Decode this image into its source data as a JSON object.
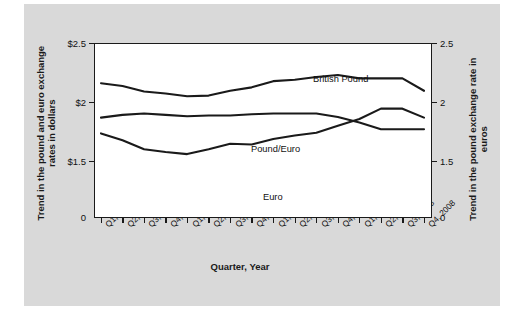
{
  "figure": {
    "background_color": "#d9d9d9",
    "plot_background_color": "#ffffff",
    "line_color": "#1a1a1a"
  },
  "axes": {
    "y_left_title": "Trend in the pound and euro exchange rates in dollars",
    "y_right_title": "Trend in the pound exchange rate in euros",
    "x_title": "Quarter, Year",
    "y_left_ticks": [
      "$2.5",
      "$2",
      "$1.5",
      "0"
    ],
    "y_right_ticks": [
      "2.5",
      "2",
      "1.5",
      "0"
    ]
  },
  "series_labels": {
    "british_pound": "British Pound",
    "pound_euro": "Pound/Euro",
    "euro": "Euro"
  },
  "chart_data": {
    "type": "line",
    "title": "",
    "xlabel": "Quarter, Year",
    "ylabel": "Trend in the pound and euro exchange rates in dollars",
    "ylabel_right": "Trend in the pound exchange rate in euros",
    "ylim": [
      0,
      2.5
    ],
    "ylim_right": [
      0,
      2.5
    ],
    "ytick_values": [
      2.5,
      2.0,
      1.5,
      0
    ],
    "ytick_labels": [
      "$2.5",
      "$2",
      "$1.5",
      "0"
    ],
    "ytick_labels_right": [
      "2.5",
      "2",
      "1.5",
      "0"
    ],
    "grid": false,
    "legend_position": "inline-annotations",
    "categories": [
      "Q1, 2005",
      "Q2, 2005",
      "Q3, 2005",
      "Q4, 2005",
      "Q1, 2006",
      "Q2, 2006",
      "Q3, 2006",
      "Q4, 2006",
      "Q1, 2007",
      "Q2, 2007",
      "Q3, 2007",
      "Q4, 2007",
      "Q1, 2008",
      "Q2, 2008",
      "Q3, 2008",
      "Q4, 2008"
    ],
    "series": [
      {
        "name": "British Pound",
        "values": [
          1.93,
          1.89,
          1.81,
          1.78,
          1.74,
          1.75,
          1.82,
          1.87,
          1.96,
          1.98,
          2.02,
          2.05,
          2.0,
          2.0,
          2.0,
          1.82
        ]
      },
      {
        "name": "Pound/Euro",
        "values": [
          1.43,
          1.47,
          1.49,
          1.47,
          1.45,
          1.46,
          1.46,
          1.48,
          1.49,
          1.49,
          1.49,
          1.44,
          1.36,
          1.26,
          1.26,
          1.26
        ]
      },
      {
        "name": "Euro",
        "values": [
          1.2,
          1.1,
          0.97,
          0.93,
          0.9,
          0.97,
          1.05,
          1.04,
          1.12,
          1.17,
          1.21,
          1.31,
          1.41,
          1.56,
          1.56,
          1.43
        ]
      }
    ]
  }
}
